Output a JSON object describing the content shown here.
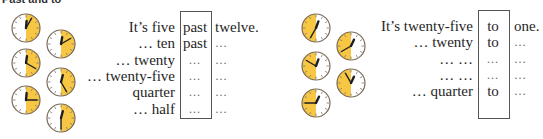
{
  "heading": "Past and to",
  "colors": {
    "accent": "#f7c744",
    "clock_face": "#ffffff",
    "clock_rim": "#7a6a55",
    "hand": "#1f1f1f"
  },
  "past_section": {
    "clocks": [
      {
        "id": "c1",
        "hour_deg": 5,
        "minute_deg": 30,
        "highlight": "right"
      },
      {
        "id": "c2",
        "hour_deg": 10,
        "minute_deg": 60,
        "highlight": "right"
      },
      {
        "id": "c3",
        "hour_deg": 8,
        "minute_deg": 120,
        "highlight": "right"
      },
      {
        "id": "c4",
        "hour_deg": 15,
        "minute_deg": 150,
        "highlight": "right"
      },
      {
        "id": "c5",
        "hour_deg": 5,
        "minute_deg": 90,
        "highlight": "right"
      },
      {
        "id": "c6",
        "hour_deg": 15,
        "minute_deg": 180,
        "highlight": "right"
      }
    ],
    "rows": [
      {
        "label": "It’s five",
        "middle": "past",
        "end": "twelve."
      },
      {
        "label": "… ten",
        "middle": "past",
        "end": "…"
      },
      {
        "label": "… twenty",
        "middle": "…",
        "end": "…"
      },
      {
        "label": "… twenty-five",
        "middle": "…",
        "end": "…"
      },
      {
        "label": "quarter",
        "middle": "…",
        "end": "…"
      },
      {
        "label": "… half",
        "middle": "…",
        "end": "…"
      }
    ]
  },
  "to_section": {
    "clocks": [
      {
        "id": "d1",
        "hour_deg": 20,
        "minute_deg": 210,
        "highlight": "left"
      },
      {
        "id": "d2",
        "hour_deg": 25,
        "minute_deg": 240,
        "highlight": "left"
      },
      {
        "id": "d3",
        "hour_deg": 20,
        "minute_deg": 300,
        "highlight": "left"
      },
      {
        "id": "d4",
        "hour_deg": 25,
        "minute_deg": 330,
        "highlight": "left"
      },
      {
        "id": "d5",
        "hour_deg": 25,
        "minute_deg": 270,
        "highlight": "left"
      }
    ],
    "rows": [
      {
        "label": "It’s twenty-five",
        "middle": "to",
        "end": "one."
      },
      {
        "label": "… twenty",
        "middle": "to",
        "end": "…"
      },
      {
        "label": "… …",
        "middle": "…",
        "end": "…"
      },
      {
        "label": "… …",
        "middle": "…",
        "end": "…"
      },
      {
        "label": "… quarter",
        "middle": "to",
        "end": "…"
      }
    ]
  }
}
